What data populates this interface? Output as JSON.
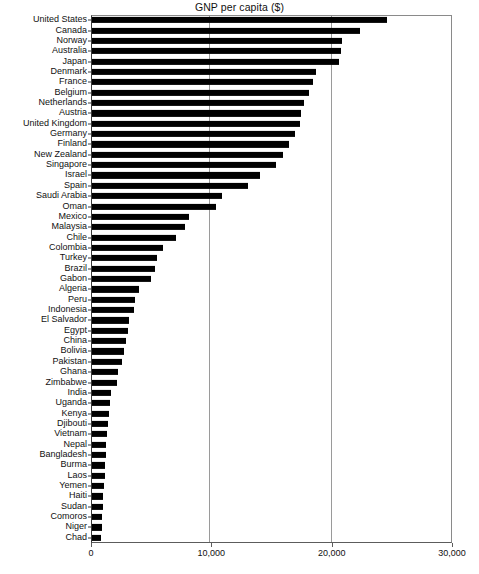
{
  "chart_data": {
    "type": "bar",
    "orientation": "horizontal",
    "title": "GNP per capita ($)",
    "xlabel": "",
    "ylabel": "",
    "xlim": [
      0,
      30000
    ],
    "xticks": [
      0,
      10000,
      20000,
      30000
    ],
    "xtick_labels": [
      "0",
      "10,000",
      "20,000",
      "30,000"
    ],
    "grid": "vertical",
    "legend": "none",
    "bar_color": "#000000",
    "categories": [
      "United States",
      "Canada",
      "Norway",
      "Australia",
      "Japan",
      "Denmark",
      "France",
      "Belgium",
      "Netherlands",
      "Austria",
      "United Kingdom",
      "Germany",
      "Finland",
      "New Zealand",
      "Singapore",
      "Israel",
      "Spain",
      "Saudi Arabia",
      "Oman",
      "Mexico",
      "Malaysia",
      "Chile",
      "Colombia",
      "Turkey",
      "Brazil",
      "Gabon",
      "Algeria",
      "Peru",
      "Indonesia",
      "El Salvador",
      "Egypt",
      "China",
      "Bolivia",
      "Pakistan",
      "Ghana",
      "Zimbabwe",
      "India",
      "Uganda",
      "Kenya",
      "Djibouti",
      "Vietnam",
      "Nepal",
      "Bangladesh",
      "Burma",
      "Laos",
      "Yemen",
      "Haiti",
      "Sudan",
      "Comoros",
      "Niger",
      "Chad"
    ],
    "values": [
      24500,
      22300,
      20800,
      20700,
      20500,
      18600,
      18400,
      18000,
      17600,
      17400,
      17300,
      16900,
      16400,
      15900,
      15300,
      14000,
      13000,
      10800,
      10300,
      8100,
      7700,
      7000,
      5900,
      5400,
      5200,
      4900,
      3900,
      3600,
      3500,
      3100,
      3000,
      2800,
      2700,
      2500,
      2200,
      2100,
      1600,
      1500,
      1400,
      1300,
      1250,
      1200,
      1150,
      1100,
      1050,
      1000,
      950,
      900,
      850,
      800,
      750
    ],
    "value_unit": "US dollars"
  }
}
